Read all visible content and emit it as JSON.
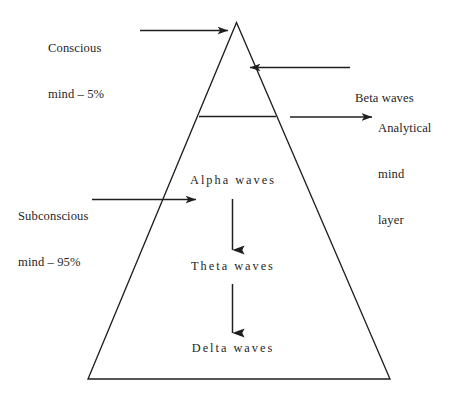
{
  "figure": {
    "background_color": "#ffffff",
    "stroke_color": "#1f1f1f"
  },
  "callouts": {
    "conscious": {
      "line1": "Conscious",
      "line2": "mind – 5%"
    },
    "beta": {
      "line1": "Beta waves"
    },
    "analytical": {
      "line1": "Analytical",
      "line2": "mind",
      "line3": "layer"
    },
    "subconscious": {
      "line1": "Subconscious",
      "line2": "mind – 95%"
    }
  },
  "pyramid": {
    "layers": [
      {
        "name": "alpha",
        "label": "Alpha waves"
      },
      {
        "name": "theta",
        "label": "Theta waves"
      },
      {
        "name": "delta",
        "label": "Delta waves"
      }
    ]
  }
}
